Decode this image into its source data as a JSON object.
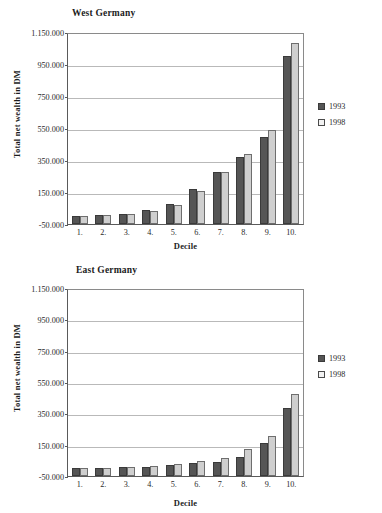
{
  "chart_data": [
    {
      "type": "bar",
      "title": "West Germany",
      "xlabel": "Decile",
      "ylabel": "Total net wealth in DM",
      "categories": [
        "1.",
        "2.",
        "3.",
        "4.",
        "5.",
        "6.",
        "7.",
        "8.",
        "9.",
        "10."
      ],
      "ylim": [
        -50000,
        1150000
      ],
      "yticks": [
        "-50.000",
        "150.000",
        "350.000",
        "550.000",
        "750.000",
        "950.000",
        "1.150.000"
      ],
      "ytick_values": [
        -50000,
        150000,
        350000,
        550000,
        750000,
        950000,
        1150000
      ],
      "grid": true,
      "legend_position": "right",
      "series": [
        {
          "name": "1993",
          "color": "#555555",
          "values": [
            2000,
            6000,
            14000,
            36000,
            72000,
            168000,
            272000,
            368000,
            492000,
            1000000
          ]
        },
        {
          "name": "1998",
          "color": "#cfcfcf",
          "values": [
            2000,
            5000,
            14000,
            34000,
            70000,
            158000,
            272000,
            385000,
            535000,
            1080000
          ]
        }
      ]
    },
    {
      "type": "bar",
      "title": "East Germany",
      "xlabel": "Decile",
      "ylabel": "Total net wealth in DM",
      "categories": [
        "1.",
        "2.",
        "3.",
        "4.",
        "5.",
        "6.",
        "7.",
        "8.",
        "9.",
        "10."
      ],
      "ylim": [
        -50000,
        1150000
      ],
      "yticks": [
        "-50.000",
        "150.000",
        "350.000",
        "550.000",
        "750.000",
        "950.000",
        "1.150.000"
      ],
      "ytick_values": [
        -50000,
        150000,
        350000,
        550000,
        750000,
        950000,
        1150000
      ],
      "grid": true,
      "legend_position": "right",
      "series": [
        {
          "name": "1993",
          "color": "#555555",
          "values": [
            1000,
            2000,
            5000,
            10000,
            20000,
            32000,
            42000,
            70000,
            160000,
            385000
          ]
        },
        {
          "name": "1998",
          "color": "#cfcfcf",
          "values": [
            1000,
            3000,
            6000,
            12000,
            26000,
            48000,
            62000,
            120000,
            205000,
            475000
          ]
        }
      ]
    }
  ],
  "legend": {
    "entries": [
      {
        "label": "1993",
        "swatch": "filled-dark-square"
      },
      {
        "label": "1998",
        "swatch": "outlined-light-square"
      }
    ]
  }
}
